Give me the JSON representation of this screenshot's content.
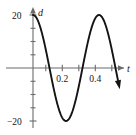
{
  "chart_data": {
    "type": "line",
    "title": "",
    "subtitle": "",
    "xlabel": "t",
    "ylabel": "d",
    "xlim": [
      -0.035,
      0.52
    ],
    "ylim": [
      -26,
      26
    ],
    "grid": false,
    "legend": null,
    "x_ticks": [
      0.1,
      0.2,
      0.3,
      0.4,
      0.5
    ],
    "x_tick_labels": [
      "",
      "0.2",
      "",
      "0.4",
      ""
    ],
    "y_ticks": [
      -20,
      -15,
      -10,
      -5,
      5,
      10,
      15,
      20
    ],
    "y_tick_labels": [
      "-20",
      "",
      "",
      "",
      "",
      "",
      "",
      "20"
    ],
    "annotations": [
      {
        "label": "maximum",
        "x": 0.0,
        "y": 20
      },
      {
        "label": "zero-crossing",
        "x": 0.1,
        "y": 0
      },
      {
        "label": "minimum",
        "x": 0.2,
        "y": -20
      },
      {
        "label": "zero-crossing",
        "x": 0.3,
        "y": 0
      },
      {
        "label": "maximum",
        "x": 0.4,
        "y": 20
      },
      {
        "label": "zero-crossing",
        "x": 0.5,
        "y": 0
      }
    ],
    "series": [
      {
        "name": "d",
        "equation": "d = 20 cos(5 pi t)",
        "amplitude": 20,
        "period": 0.4,
        "x": [
          0.0,
          0.01,
          0.02,
          0.03,
          0.04,
          0.05,
          0.06,
          0.07,
          0.08,
          0.09,
          0.1,
          0.11,
          0.12,
          0.13,
          0.14,
          0.15,
          0.16,
          0.17,
          0.18,
          0.19,
          0.2,
          0.21,
          0.22,
          0.23,
          0.24,
          0.25,
          0.26,
          0.27,
          0.28,
          0.29,
          0.3,
          0.31,
          0.32,
          0.33,
          0.34,
          0.35,
          0.36,
          0.37,
          0.38,
          0.39,
          0.4,
          0.41,
          0.42,
          0.43,
          0.44,
          0.45,
          0.46,
          0.47,
          0.48,
          0.49,
          0.5,
          0.51,
          0.52
        ],
        "values": [
          20.0,
          19.75,
          19.02,
          17.82,
          16.18,
          14.14,
          11.76,
          9.08,
          6.18,
          3.13,
          0.0,
          -3.13,
          -6.18,
          -9.08,
          -11.76,
          -14.14,
          -16.18,
          -17.82,
          -19.02,
          -19.75,
          -20.0,
          -19.75,
          -19.02,
          -17.82,
          -16.18,
          -14.14,
          -11.76,
          -9.08,
          -6.18,
          -3.13,
          0.0,
          3.13,
          6.18,
          9.08,
          11.76,
          14.14,
          16.18,
          17.82,
          19.02,
          19.75,
          20.0,
          19.75,
          19.02,
          17.82,
          16.18,
          14.14,
          11.76,
          9.08,
          6.18,
          3.13,
          0.0,
          -3.13,
          -6.18
        ]
      }
    ]
  },
  "labels": {
    "y_axis_name": "d",
    "x_axis_name": "t",
    "y_top": "20",
    "y_bottom": "−20",
    "x_tick_1": "0.2",
    "x_tick_2": "0.4"
  }
}
